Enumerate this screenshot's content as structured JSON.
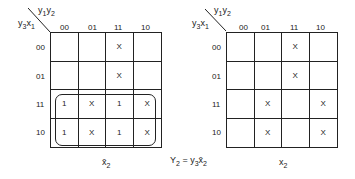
{
  "maps": [
    {
      "id": "left",
      "col_var_label": "y1y2",
      "row_var_label": "y3x1",
      "col_headers": [
        "00",
        "01",
        "11",
        "10"
      ],
      "row_headers": [
        "00",
        "01",
        "11",
        "10"
      ],
      "cells": [
        [
          "",
          "",
          "X",
          ""
        ],
        [
          "",
          "",
          "X",
          ""
        ],
        [
          "1",
          "X",
          "1",
          "X"
        ],
        [
          "1",
          "X",
          "1",
          "X"
        ]
      ],
      "caption": "x̄2",
      "loop": "rows 11 and 10"
    },
    {
      "id": "right",
      "col_var_label": "y1y2",
      "row_var_label": "y3x1",
      "col_headers": [
        "00",
        "01",
        "11",
        "10"
      ],
      "row_headers": [
        "00",
        "01",
        "11",
        "10"
      ],
      "cells": [
        [
          "",
          "",
          "X",
          ""
        ],
        [
          "",
          "",
          "X",
          ""
        ],
        [
          "",
          "X",
          "",
          "X"
        ],
        [
          "",
          "X",
          "",
          "X"
        ]
      ],
      "caption": "x2"
    }
  ],
  "equation": "Y2 = y3x̄2"
}
